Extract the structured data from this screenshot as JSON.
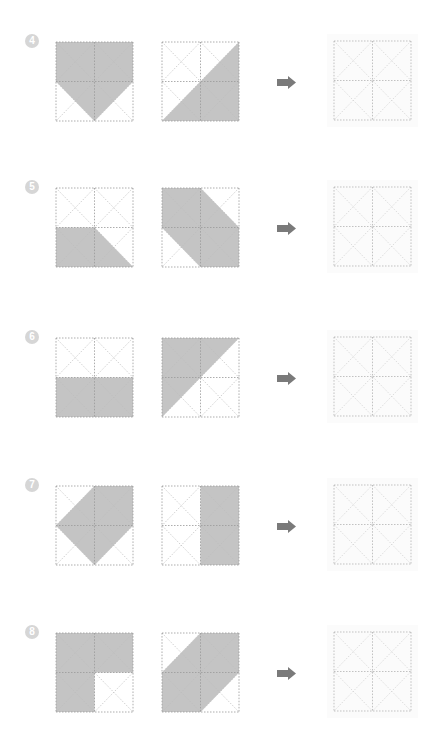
{
  "worksheet": {
    "colors": {
      "shade": "#c4c4c4",
      "grid_line": "#9a9a9a",
      "diag_line": "#bdbdbd",
      "arrow": "#7a7a7a",
      "badge": "#d6d6d6"
    },
    "problems": [
      {
        "number": "4",
        "top": 42,
        "shape_a": "0,0 2,0 2,1 1,2 0,1",
        "shape_b": "2,0 2,2 0,2",
        "arrow_icon": "right-arrow-icon"
      },
      {
        "number": "5",
        "top": 188,
        "shape_a": "0,1 1,1 2,2 0,2",
        "shape_b": "0,0 1,0 2,1 2,2 1,2 0,1",
        "arrow_icon": "right-arrow-icon"
      },
      {
        "number": "6",
        "top": 338,
        "shape_a": "0,1 2,1 2,2 0,2",
        "shape_b": "0,0 2,0 0,2",
        "arrow_icon": "right-arrow-icon"
      },
      {
        "number": "7",
        "top": 486,
        "shape_a": "1,0 2,0 2,1 1,2 0,1",
        "shape_b": "1,0 2,0 2,2 1,2",
        "arrow_icon": "right-arrow-icon"
      },
      {
        "number": "8",
        "top": 633,
        "shape_a": "0,0 2,0 2,1 1,1 1,2 0,2",
        "shape_b": "1,0 2,0 2,1 1,2 0,2 0,1",
        "arrow_icon": "right-arrow-icon"
      }
    ]
  }
}
